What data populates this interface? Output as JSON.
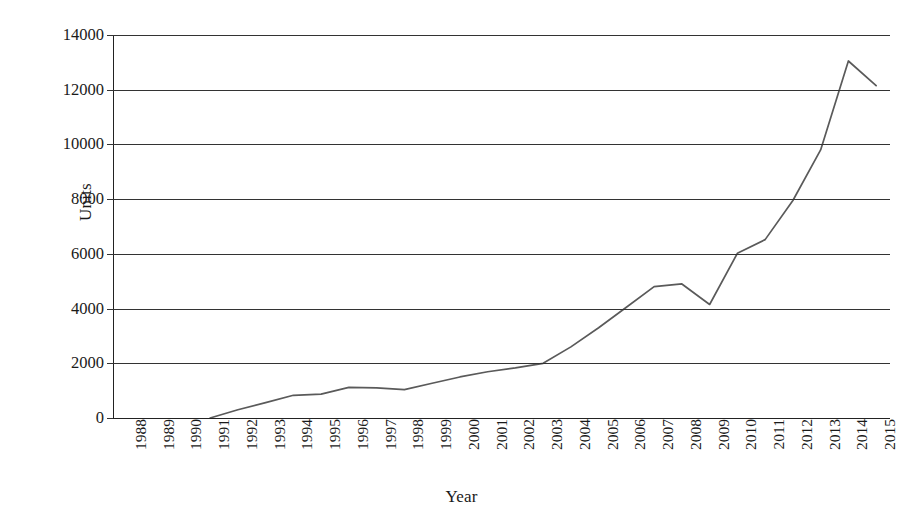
{
  "chart_data": {
    "type": "line",
    "title": "",
    "xlabel": "Year",
    "ylabel": "Units",
    "categories": [
      "1988",
      "1989",
      "1990",
      "1991",
      "1992",
      "1993",
      "1994",
      "1995",
      "1996",
      "1997",
      "1998",
      "1999",
      "2000",
      "2001",
      "2002",
      "2003",
      "2004",
      "2005",
      "2006",
      "2007",
      "2008",
      "2009",
      "2010",
      "2011",
      "2012",
      "2013",
      "2014",
      "2015"
    ],
    "values": [
      null,
      null,
      null,
      0,
      300,
      560,
      830,
      870,
      1120,
      1100,
      1040,
      1270,
      1500,
      1690,
      1830,
      2000,
      2600,
      3300,
      4050,
      4800,
      4900,
      4150,
      6020,
      6520,
      7950,
      9800,
      13050,
      12150
    ],
    "ylim": [
      0,
      14000
    ],
    "ytick_values": [
      0,
      2000,
      4000,
      6000,
      8000,
      10000,
      12000,
      14000
    ],
    "ytick_labels": [
      "0",
      "2000",
      "4000",
      "6000",
      "8000",
      "10000",
      "12000",
      "14000"
    ],
    "grid": "horizontal",
    "legend": "none",
    "series_color": "#5a5a5a",
    "grid_color": "#333333",
    "axis_color": "#222222",
    "background": "#ffffff",
    "xtick_rotation": "-90",
    "first_data_year": "1991"
  }
}
